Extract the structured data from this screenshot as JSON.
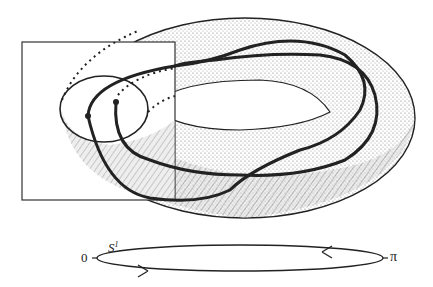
{
  "figure": {
    "labels": {
      "circle_name": "S",
      "circle_superscript": "1",
      "left_point": "0",
      "right_point": "π"
    },
    "colors": {
      "ink": "#222222",
      "shade": "#8a8a8a",
      "background": "#ffffff"
    }
  }
}
